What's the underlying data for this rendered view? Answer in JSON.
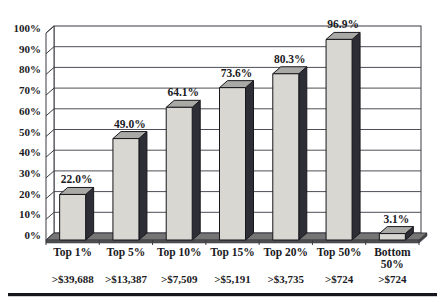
{
  "chart_data": {
    "type": "bar",
    "style": "3d-column",
    "title": "",
    "xlabel": "",
    "ylabel": "",
    "categories": [
      "Top 1%",
      "Top 5%",
      "Top 10%",
      "Top 15%",
      "Top 20%",
      "Top 50%",
      "Bottom 50%"
    ],
    "category_lines": [
      [
        "Top 1%"
      ],
      [
        "Top 5%"
      ],
      [
        "Top 10%"
      ],
      [
        "Top 15%"
      ],
      [
        "Top 20%"
      ],
      [
        "Top 50%"
      ],
      [
        "Bottom",
        "50%"
      ]
    ],
    "values": [
      22.0,
      49.0,
      64.1,
      73.6,
      80.3,
      96.9,
      3.1
    ],
    "value_labels": [
      "22.0%",
      "49.0%",
      "64.1%",
      "73.6%",
      "80.3%",
      "96.9%",
      "3.1%"
    ],
    "income_thresholds": [
      ">$39,688",
      ">$13,387",
      ">$7,509",
      ">$5,191",
      ">$3,735",
      ">$724",
      ">$724"
    ],
    "y_axis": {
      "min": 0,
      "max": 100,
      "step": 10,
      "tick_labels": [
        "100%",
        "90%",
        "80%",
        "70%",
        "60%",
        "50%",
        "40%",
        "30%",
        "20%",
        "10%",
        "0%"
      ]
    },
    "grid": true,
    "legend": false,
    "colors": {
      "background": "#ffffff",
      "bar_front": "#d8d7d2",
      "bar_side": "#2e2e36",
      "bar_top": "#a9a9a5",
      "bar_outline": "#17171d",
      "gridline": "#4d4d55",
      "wall_line": "#3a3a42",
      "floor_top": "#757575",
      "floor_front": "#4f4f4f",
      "floor_cap": "#434343",
      "text": "#1b1b24",
      "bottom_rule": "#15151c"
    }
  }
}
